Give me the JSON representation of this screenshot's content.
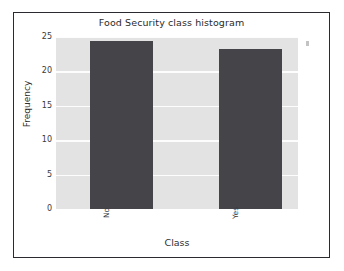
{
  "chart_data": {
    "type": "bar",
    "title": "Food Security class histogram",
    "xlabel": "Class",
    "ylabel": "Frequency",
    "categories": [
      "No",
      "Yes"
    ],
    "values": [
      24.4,
      23.2
    ],
    "ylim": [
      0,
      25
    ],
    "xlim_note": "categorical",
    "yticks": [
      0,
      5,
      10,
      15,
      20,
      25
    ],
    "ytick_labels": [
      "0",
      "5",
      "10",
      "15",
      "20",
      "25"
    ],
    "grid": true,
    "grid_axis": "y",
    "legend": null,
    "legend_position": "none",
    "style": {
      "plot_background": "#e3e3e3",
      "gridline_color": "#fdfdfd",
      "bar_color": "#454549",
      "figure_background": "#ffffff",
      "frame_color": "#2b2b2f",
      "text_color": "#2f2f2f"
    },
    "xtick_rotation_degrees": 90,
    "bars": [
      {
        "category": "No",
        "value": 24.4
      },
      {
        "category": "Yes",
        "value": 23.2
      }
    ]
  }
}
